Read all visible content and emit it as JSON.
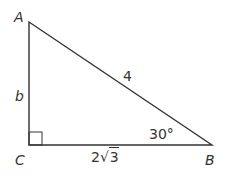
{
  "diagram": {
    "type": "right-triangle",
    "vertices": {
      "A": {
        "label": "A",
        "x": 29,
        "y": 22
      },
      "B": {
        "label": "B",
        "x": 212,
        "y": 145
      },
      "C": {
        "label": "C",
        "x": 29,
        "y": 145
      }
    },
    "sides": {
      "AC": {
        "label": "b"
      },
      "AB": {
        "label": "4"
      },
      "CB": {
        "label_coef": "2",
        "label_radicand": "3"
      }
    },
    "angles": {
      "B": {
        "label": "30°"
      },
      "C": {
        "right_angle": true
      }
    },
    "colors": {
      "stroke": "#333333",
      "text": "#333333",
      "background": "#ffffff"
    }
  }
}
